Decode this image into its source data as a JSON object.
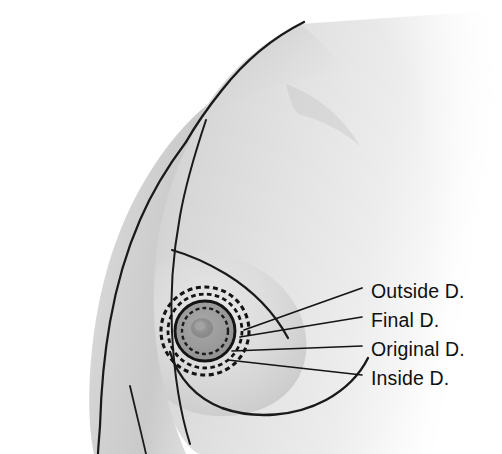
{
  "figure": {
    "background_color": "#ffffff",
    "ink_color": "#101010",
    "skin_light": "#f2f2f2",
    "skin_mid": "#d9d9d9",
    "skin_shadow": "#b9b9b9",
    "areola_fill": "#9a9a9a",
    "nipple_fill": "#8a8a8a"
  },
  "callouts": [
    {
      "id": "outside-d",
      "label": "Outside D.",
      "text_x": 371,
      "text_y": 282,
      "leader_from_x": 244,
      "leader_from_y": 330,
      "leader_to_x": 362,
      "leader_to_y": 288
    },
    {
      "id": "final-d",
      "label": "Final D.",
      "text_x": 371,
      "text_y": 311,
      "leader_from_x": 240,
      "leader_from_y": 337,
      "leader_to_x": 362,
      "leader_to_y": 317
    },
    {
      "id": "original-d",
      "label": "Original D.",
      "text_x": 371,
      "text_y": 340,
      "leader_from_x": 232,
      "leader_from_y": 351,
      "leader_to_x": 362,
      "leader_to_y": 346
    },
    {
      "id": "inside-d",
      "label": "Inside D.",
      "text_x": 371,
      "text_y": 369,
      "leader_from_x": 228,
      "leader_from_y": 360,
      "leader_to_x": 362,
      "leader_to_y": 375
    }
  ],
  "areola_rings": [
    {
      "id": "outside-ring",
      "label": "Outside D.",
      "radius": 44,
      "style": "dashed"
    },
    {
      "id": "final-ring",
      "label": "Final D.",
      "radius": 37,
      "style": "dashed"
    },
    {
      "id": "original-ring",
      "label": "Original D.",
      "radius": 30,
      "style": "solid"
    },
    {
      "id": "inside-ring",
      "label": "Inside D.",
      "radius": 23,
      "style": "dashed"
    }
  ],
  "areola_center": {
    "x": 205,
    "y": 331
  }
}
